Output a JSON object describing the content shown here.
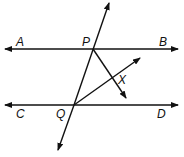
{
  "diagram": {
    "type": "geometry",
    "labels": {
      "A": "A",
      "B": "B",
      "P": "P",
      "X": "X",
      "C": "C",
      "D": "D",
      "Q": "Q"
    },
    "colors": {
      "stroke": "#111111",
      "background": "#ffffff"
    }
  }
}
